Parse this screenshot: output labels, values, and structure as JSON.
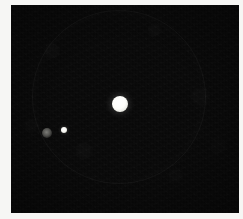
{
  "view": {
    "kind": "astronomical-image-frame",
    "width": 243,
    "height": 219,
    "background_color": "#f6f6f4",
    "frame_color": "#080808",
    "caption": ""
  },
  "frame": {
    "left": 11,
    "top": 5,
    "width": 228,
    "height": 208,
    "noise": "sensor-grain"
  },
  "halo": {
    "name": "faint-ring-artifact",
    "center_x": 118,
    "center_y": 96,
    "radius": 86,
    "color": "#2a2a2a"
  },
  "objects": [
    {
      "id": "primary",
      "label": "bright-disk",
      "x": 120,
      "y": 104,
      "radius": 8,
      "brightness": "saturated",
      "color": "#ffffff"
    },
    {
      "id": "satellite",
      "label": "small-bright-point",
      "x": 64,
      "y": 130,
      "radius": 3,
      "brightness": "bright",
      "color": "#fdfdf8"
    },
    {
      "id": "faint",
      "label": "dim-diffuse-blob",
      "x": 47,
      "y": 133,
      "radius": 5,
      "brightness": "dim",
      "color": "#8a8a85"
    }
  ]
}
